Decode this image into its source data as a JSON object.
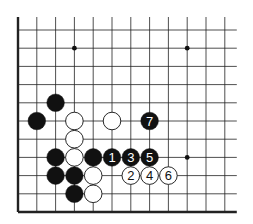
{
  "diagram": {
    "type": "go-board-fragment",
    "columns": 12,
    "rows": 11,
    "open_edges": [
      "top",
      "right"
    ],
    "closed_edges": [
      "left",
      "bottom"
    ],
    "grid": {
      "origin_x": 18,
      "origin_y": 30,
      "dx": 18.8,
      "dy": 18.2
    },
    "colors": {
      "line": "#222222",
      "black_stone": "#111111",
      "white_stone": "#ffffff",
      "star": "#111111"
    },
    "star_points": [
      {
        "col": 3,
        "row": 1
      },
      {
        "col": 9,
        "row": 1
      },
      {
        "col": 9,
        "row": 7
      }
    ],
    "stones": [
      {
        "col": 2,
        "row": 4,
        "color": "black",
        "label": ""
      },
      {
        "col": 1,
        "row": 5,
        "color": "black",
        "label": ""
      },
      {
        "col": 3,
        "row": 5,
        "color": "white",
        "label": ""
      },
      {
        "col": 5,
        "row": 5,
        "color": "white",
        "label": ""
      },
      {
        "col": 7,
        "row": 5,
        "color": "black",
        "label": "7"
      },
      {
        "col": 3,
        "row": 6,
        "color": "white",
        "label": ""
      },
      {
        "col": 2,
        "row": 7,
        "color": "black",
        "label": ""
      },
      {
        "col": 3,
        "row": 7,
        "color": "white",
        "label": ""
      },
      {
        "col": 4,
        "row": 7,
        "color": "black",
        "label": ""
      },
      {
        "col": 5,
        "row": 7,
        "color": "black",
        "label": "1"
      },
      {
        "col": 6,
        "row": 7,
        "color": "black",
        "label": "3"
      },
      {
        "col": 7,
        "row": 7,
        "color": "black",
        "label": "5"
      },
      {
        "col": 2,
        "row": 8,
        "color": "black",
        "label": ""
      },
      {
        "col": 3,
        "row": 8,
        "color": "black",
        "label": ""
      },
      {
        "col": 4,
        "row": 8,
        "color": "white",
        "label": ""
      },
      {
        "col": 6,
        "row": 8,
        "color": "white",
        "label": "2"
      },
      {
        "col": 7,
        "row": 8,
        "color": "white",
        "label": "4"
      },
      {
        "col": 8,
        "row": 8,
        "color": "white",
        "label": "6"
      },
      {
        "col": 3,
        "row": 9,
        "color": "black",
        "label": ""
      },
      {
        "col": 4,
        "row": 9,
        "color": "white",
        "label": ""
      }
    ]
  }
}
